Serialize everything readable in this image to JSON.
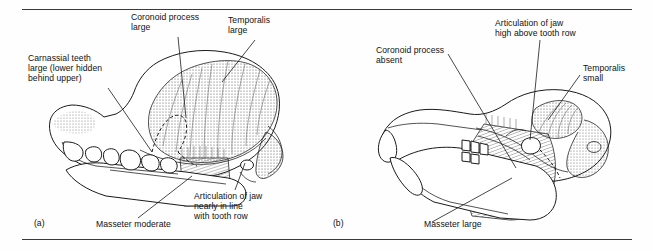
{
  "figure": {
    "panel_a": {
      "id": "(a)",
      "labels": {
        "carnassial": "Carnassial teeth\nlarge (lower hidden\nbehind upper)",
        "coronoid": "Coronoid process\nlarge",
        "temporalis": "Temporalis\nlarge",
        "articulation": "Articulation of jaw\nnearly in line\nwith tooth row",
        "masseter": "Masseter moderate"
      }
    },
    "panel_b": {
      "id": "(b)",
      "labels": {
        "coronoid": "Coronoid process\nabsent",
        "articulation": "Articulation of jaw\nhigh above tooth row",
        "temporalis": "Temporalis\nsmall",
        "masseter": "Masseter large"
      }
    },
    "colors": {
      "ink": "#1a1a1a",
      "rule": "#3a3a3a",
      "paper": "#fefefe",
      "stipple": "#4a4a4a",
      "hatch": "#333333"
    }
  }
}
